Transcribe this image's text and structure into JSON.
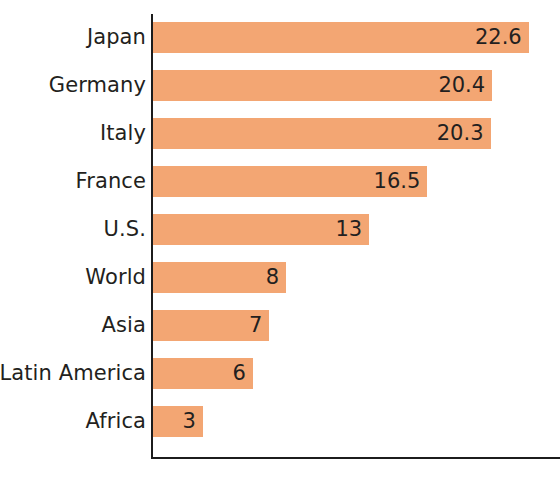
{
  "chart_data": {
    "type": "bar",
    "orientation": "horizontal",
    "title": "",
    "subtitle": "",
    "xlabel": "",
    "ylabel": "",
    "categories": [
      "Japan",
      "Germany",
      "Italy",
      "France",
      "U.S.",
      "World",
      "Asia",
      "Latin America",
      "Africa"
    ],
    "values": [
      22.6,
      20.4,
      20.3,
      16.5,
      13,
      8,
      7,
      6,
      3
    ],
    "value_labels": [
      "22.6",
      "20.4",
      "20.3",
      "16.5",
      "13",
      "8",
      "7",
      "6",
      "3"
    ],
    "xlim": [
      0,
      24.6
    ],
    "grid": false,
    "legend": null,
    "bar_color": "#f3a673",
    "axis_color": "#1c1c1c",
    "text_color": "#231f20",
    "background": "#ffffff",
    "bars": [
      {
        "category": "Japan",
        "value": 22.6,
        "label": "22.6"
      },
      {
        "category": "Germany",
        "value": 20.4,
        "label": "20.4"
      },
      {
        "category": "Italy",
        "value": 20.3,
        "label": "20.3"
      },
      {
        "category": "France",
        "value": 16.5,
        "label": "16.5"
      },
      {
        "category": "U.S.",
        "value": 13,
        "label": "13"
      },
      {
        "category": "World",
        "value": 8,
        "label": "8"
      },
      {
        "category": "Asia",
        "value": 7,
        "label": "7"
      },
      {
        "category": "Latin America",
        "value": 6,
        "label": "6"
      },
      {
        "category": "Africa",
        "value": 3,
        "label": "3"
      }
    ]
  }
}
